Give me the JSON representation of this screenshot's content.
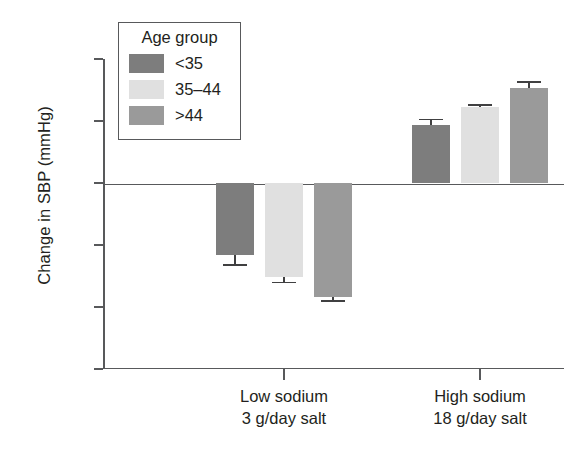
{
  "chart_data": {
    "type": "bar",
    "title": "",
    "xlabel": "",
    "ylabel": "Change in SBP (mmHg)",
    "ylim": [
      -15,
      10
    ],
    "yticks": [
      10,
      5,
      0,
      -5,
      -10,
      -15
    ],
    "ytick_labels": [
      "10",
      "5",
      "0",
      "–5",
      "–10",
      "–15"
    ],
    "grid": false,
    "legend_position": "upper-left-inside",
    "legend_title": "Age group",
    "categories": [
      "Low sodium\n3 g/day salt",
      "High sodium\n18 g/day salt"
    ],
    "category_labels": [
      {
        "line1": "Low sodium",
        "line2": "3 g/day salt"
      },
      {
        "line1": "High sodium",
        "line2": "18 g/day salt"
      }
    ],
    "series": [
      {
        "name": "<35",
        "color": "#7d7d7d",
        "values": [
          -5.8,
          4.7
        ],
        "errors": [
          0.9,
          0.5
        ]
      },
      {
        "name": "35–44",
        "color": "#e0e0e0",
        "values": [
          -7.6,
          6.1
        ],
        "errors": [
          0.5,
          0.3
        ]
      },
      {
        "name": ">44",
        "color": "#9a9a9a",
        "values": [
          -9.2,
          7.7
        ],
        "errors": [
          0.4,
          0.5
        ]
      }
    ]
  },
  "axis": {
    "y_title": "Change in SBP (mmHg)"
  },
  "legend": {
    "title": "Age group",
    "items": [
      {
        "label": "<35",
        "color": "#7d7d7d"
      },
      {
        "label": "35–44",
        "color": "#e0e0e0"
      },
      {
        "label": ">44",
        "color": "#9a9a9a"
      }
    ]
  },
  "colors": {
    "axis": "#58595b",
    "text": "#231f20",
    "error_bar": "#404041",
    "background": "#ffffff"
  }
}
